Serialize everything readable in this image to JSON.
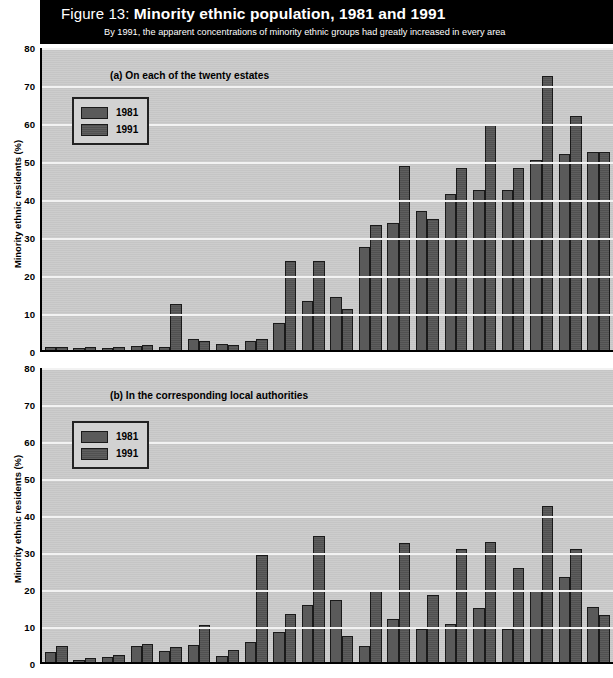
{
  "figure": {
    "label": "Figure 13:",
    "title": "Minority ethnic population, 1981 and 1991",
    "subtitle": "By 1991, the apparent concentrations of minority ethnic groups had greatly increased in every area"
  },
  "colors": {
    "titlebar_bg": "#000000",
    "titlebar_text": "#ffffff",
    "plot_bg": "#c9c9c9",
    "gridline": "#f2f2f2",
    "bar_1981": "#5a5a5a",
    "bar_1991": "#555555",
    "axis": "#000000"
  },
  "legend": {
    "entries": [
      {
        "key": "1981",
        "label": "1981",
        "swatch": "bar_1981"
      },
      {
        "key": "1991",
        "label": "1991",
        "swatch": "bar_1991"
      }
    ]
  },
  "axis": {
    "ylabel": "Minority ethnic residents (%)",
    "yticks": [
      "80",
      "70",
      "60",
      "50",
      "40",
      "30",
      "20",
      "10",
      "0"
    ],
    "ymin": 0,
    "ymax": 80
  },
  "panels": [
    {
      "id": "a",
      "label": "(a) On each of the twenty estates"
    },
    {
      "id": "b",
      "label": "(b) In the corresponding local authorities"
    }
  ],
  "chart_data": [
    {
      "type": "bar",
      "panel": "a",
      "title": "(a) On each of the twenty estates",
      "xlabel": "",
      "ylabel": "Minority ethnic residents (%)",
      "ylim": [
        0,
        80
      ],
      "yticks": [
        0,
        10,
        20,
        30,
        40,
        50,
        60,
        70,
        80
      ],
      "grid": true,
      "legend_position": "upper-left",
      "categories": [
        "Estate 1",
        "Estate 2",
        "Estate 3",
        "Estate 4",
        "Estate 5",
        "Estate 6",
        "Estate 7",
        "Estate 8",
        "Estate 9",
        "Estate 10",
        "Estate 11",
        "Estate 12",
        "Estate 13",
        "Estate 14",
        "Estate 15",
        "Estate 16",
        "Estate 17",
        "Estate 18",
        "Estate 19",
        "Estate 20"
      ],
      "series": [
        {
          "name": "1981",
          "values": [
            0.7,
            0.6,
            0.5,
            1.0,
            0.8,
            2.8,
            1.5,
            2.3,
            7.0,
            13.0,
            14.0,
            27.0,
            33.5,
            36.5,
            41.0,
            42.0,
            42.0,
            50.0,
            51.5,
            52.0
          ]
        },
        {
          "name": "1991",
          "values": [
            0.8,
            0.7,
            0.9,
            1.2,
            12.0,
            2.3,
            1.3,
            3.0,
            23.5,
            23.5,
            10.8,
            33.0,
            48.5,
            34.5,
            48.0,
            59.5,
            48.0,
            72.0,
            61.5,
            52.0
          ]
        }
      ]
    },
    {
      "type": "bar",
      "panel": "b",
      "title": "(b) In the corresponding local authorities",
      "xlabel": "",
      "ylabel": "Minority ethnic residents (%)",
      "ylim": [
        0,
        80
      ],
      "yticks": [
        0,
        10,
        20,
        30,
        40,
        50,
        60,
        70,
        80
      ],
      "grid": true,
      "legend_position": "upper-left",
      "categories": [
        "Authority 1",
        "Authority 2",
        "Authority 3",
        "Authority 4",
        "Authority 5",
        "Authority 6",
        "Authority 7",
        "Authority 8",
        "Authority 9",
        "Authority 10",
        "Authority 11",
        "Authority 12",
        "Authority 13",
        "Authority 14",
        "Authority 15",
        "Authority 16",
        "Authority 17",
        "Authority 18",
        "Authority 19",
        "Authority 20"
      ],
      "series": [
        {
          "name": "1981",
          "values": [
            2.6,
            0.6,
            1.3,
            4.2,
            3.0,
            4.5,
            1.5,
            5.5,
            8.2,
            15.5,
            16.8,
            4.2,
            11.5,
            9.0,
            10.2,
            14.5,
            9.0,
            19.2,
            23.0,
            14.8
          ]
        },
        {
          "name": "1991",
          "values": [
            4.3,
            1.0,
            2.0,
            5.0,
            4.0,
            10.0,
            3.2,
            29.0,
            13.0,
            34.0,
            7.0,
            19.3,
            32.3,
            18.0,
            30.5,
            32.5,
            25.5,
            42.2,
            30.5,
            12.7
          ]
        }
      ]
    }
  ]
}
